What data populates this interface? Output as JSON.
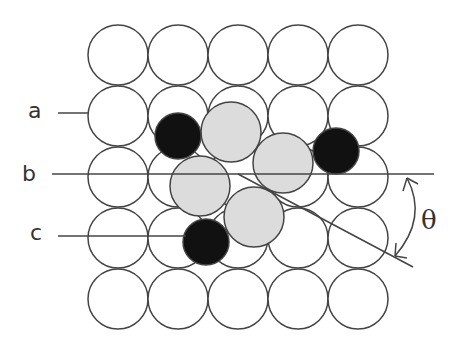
{
  "figure": {
    "labels": {
      "a": "a",
      "b": "b",
      "c": "c",
      "theta": "θ"
    },
    "colors": {
      "substrate_fill": "#ffffff",
      "outline": "#444444",
      "gray_atom": "#dcdcdc",
      "black_atom": "#111111"
    },
    "substrate_grid": {
      "rows": 5,
      "cols": 5,
      "x0": 118,
      "y0": 55,
      "pitch_x": 60,
      "pitch_y": 61,
      "radius": 30
    },
    "gray_atoms": [
      {
        "cx": 231,
        "cy": 132,
        "r": 30
      },
      {
        "cx": 283,
        "cy": 163,
        "r": 30
      },
      {
        "cx": 200,
        "cy": 186,
        "r": 30
      },
      {
        "cx": 254,
        "cy": 217,
        "r": 30
      }
    ],
    "black_atoms": [
      {
        "cx": 178,
        "cy": 136,
        "r": 23
      },
      {
        "cx": 336,
        "cy": 151,
        "r": 23
      },
      {
        "cx": 206,
        "cy": 242,
        "r": 23
      }
    ]
  }
}
